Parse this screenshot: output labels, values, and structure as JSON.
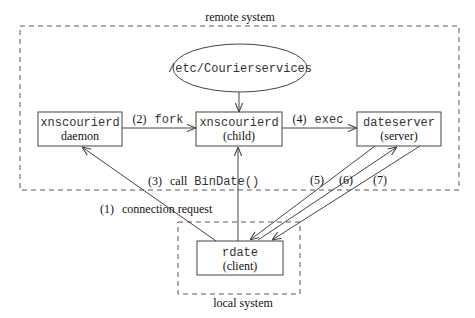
{
  "diagram": {
    "regions": {
      "remote": {
        "label": "remote system"
      },
      "local": {
        "label": "local system"
      }
    },
    "config_file": {
      "label": "/etc/Courierservices"
    },
    "nodes": {
      "daemon": {
        "name": "xnscourierd",
        "role": "daemon"
      },
      "child": {
        "name": "xnscourierd",
        "role": "(child)"
      },
      "server": {
        "name": "dateserver",
        "role": "(server)"
      },
      "client": {
        "name": "rdate",
        "role": "(client)"
      }
    },
    "edges": {
      "e1": {
        "num": "(1)",
        "text": "connection request",
        "from": "client",
        "to": "daemon"
      },
      "e2": {
        "num": "(2)",
        "text": "fork",
        "from": "daemon",
        "to": "child"
      },
      "e3": {
        "num": "(3)",
        "text_serif": "call",
        "text_mono": "BinDate()",
        "from": "client",
        "to": "child"
      },
      "e4": {
        "num": "(4)",
        "text": "exec",
        "from": "child",
        "to": "server"
      },
      "e5": {
        "num": "(5)",
        "from": "server",
        "to": "client"
      },
      "e6": {
        "num": "(6)",
        "from": "client",
        "to": "server"
      },
      "e7": {
        "num": "(7)",
        "from": "server",
        "to": "client"
      },
      "cfg": {
        "from": "config_file",
        "to": "child"
      }
    }
  }
}
